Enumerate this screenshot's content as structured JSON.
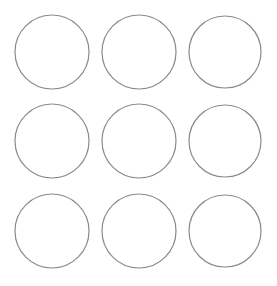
{
  "diagram": {
    "rows": 3,
    "cols": 3,
    "stroke_color": "#8a8a8a",
    "fill_color": "#ffffff",
    "circles": [
      {
        "row": 0,
        "col": 0,
        "cx": 52,
        "cy": 52,
        "r": 37
      },
      {
        "row": 0,
        "col": 1,
        "cx": 139,
        "cy": 52,
        "r": 37
      },
      {
        "row": 0,
        "col": 2,
        "cx": 225,
        "cy": 52,
        "r": 36
      },
      {
        "row": 1,
        "col": 0,
        "cx": 52,
        "cy": 141,
        "r": 37
      },
      {
        "row": 1,
        "col": 1,
        "cx": 139,
        "cy": 141,
        "r": 37
      },
      {
        "row": 1,
        "col": 2,
        "cx": 225,
        "cy": 141,
        "r": 36
      },
      {
        "row": 2,
        "col": 0,
        "cx": 52,
        "cy": 231,
        "r": 37
      },
      {
        "row": 2,
        "col": 1,
        "cx": 139,
        "cy": 231,
        "r": 37
      },
      {
        "row": 2,
        "col": 2,
        "cx": 225,
        "cy": 231,
        "r": 36
      }
    ]
  }
}
